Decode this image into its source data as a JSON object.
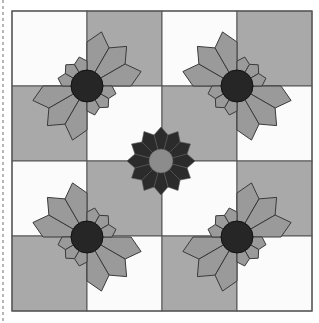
{
  "colors": {
    "page_bg": "#ffffff",
    "cell_white": "#fbfbfb",
    "cell_gray": "#a9a9a9",
    "petal_fill": "#9a9a9a",
    "petal_stroke": "#3a3a3a",
    "center_dark": "#262626",
    "plate_dark": "#2b2b2b",
    "plate_line": "#555555",
    "plate_center": "#8c8c8c",
    "grid_line": "#555555",
    "dash_line": "#888888"
  },
  "grid": {
    "x0": 12,
    "y0": 11,
    "cell": 75,
    "rows": 4,
    "cols": 4,
    "pattern": [
      [
        "W",
        "G",
        "W",
        "G"
      ],
      [
        "G",
        "W",
        "G",
        "W"
      ],
      [
        "W",
        "G",
        "W",
        "G"
      ],
      [
        "G",
        "W",
        "G",
        "W"
      ]
    ]
  },
  "dashed_edge": {
    "x": 3,
    "y1": 0,
    "y2": 323
  },
  "fans": [
    {
      "name": "fan-top-left",
      "cx": 87,
      "cy": 86,
      "large_quadrants": [
        "NE",
        "SW"
      ],
      "small_quadrants": [
        "NW",
        "SE"
      ]
    },
    {
      "name": "fan-top-right",
      "cx": 237,
      "cy": 86,
      "large_quadrants": [
        "NW",
        "SE"
      ],
      "small_quadrants": [
        "NE",
        "SW"
      ]
    },
    {
      "name": "fan-bottom-left",
      "cx": 87,
      "cy": 237,
      "large_quadrants": [
        "NW",
        "SE"
      ],
      "small_quadrants": [
        "NE",
        "SW"
      ]
    },
    {
      "name": "fan-bottom-right",
      "cx": 237,
      "cy": 237,
      "large_quadrants": [
        "NE",
        "SW"
      ],
      "small_quadrants": [
        "NW",
        "SE"
      ]
    }
  ],
  "fan_geometry": {
    "center_radius": 16,
    "large_petal_radius": 56,
    "large_petal_shoulder": 44,
    "small_petal_radius": 30,
    "small_petal_shoulder": 25,
    "petals_per_quadrant": 3
  },
  "center_plate": {
    "cx": 161,
    "cy": 161,
    "petal_count": 12,
    "outer_radius": 34,
    "shoulder_radius": 27,
    "inner_radius": 12
  }
}
